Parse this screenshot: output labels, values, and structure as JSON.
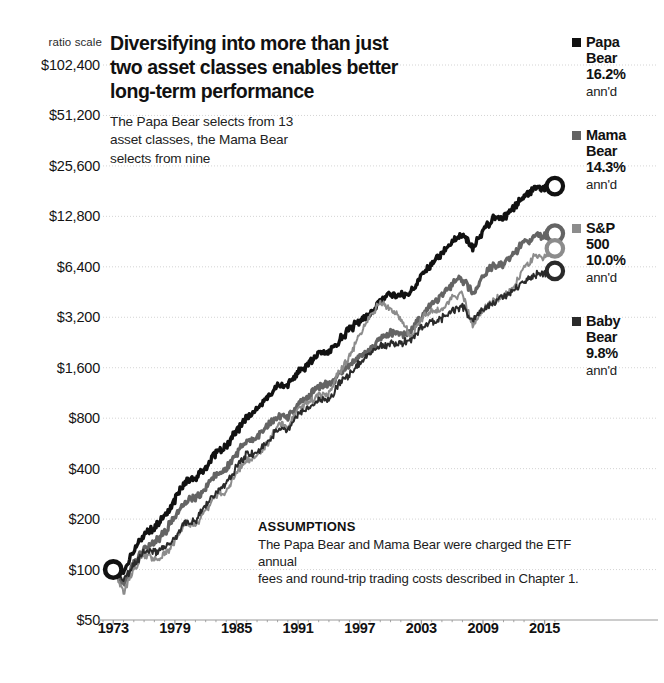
{
  "title": {
    "line1": "Diversifying into more than just",
    "line2": "two asset classes enables better",
    "line3": "long-term performance"
  },
  "subtitle": "The Papa Bear selects from 13 asset classes, the Mama Bear selects from nine",
  "scale_note": "ratio scale",
  "assumptions": {
    "heading": "ASSUMPTIONS",
    "line1": "The Papa Bear and Mama Bear were charged the ETF annual",
    "line2": "fees and round-trip trading costs described in Chapter 1."
  },
  "legend": [
    {
      "name_line1": "Papa",
      "name_line2": "Bear",
      "pct": "16.2%",
      "ann": "ann'd",
      "color": "#111111"
    },
    {
      "name_line1": "Mama",
      "name_line2": "Bear",
      "pct": "14.3%",
      "ann": "ann'd",
      "color": "#646464"
    },
    {
      "name_line1": "S&P",
      "name_line2": "500",
      "pct": "10.0%",
      "ann": "ann'd",
      "color": "#8c8c8c"
    },
    {
      "name_line1": "Baby",
      "name_line2": "Bear",
      "pct": "9.8%",
      "ann": "ann'd",
      "color": "#2a2a2a"
    }
  ],
  "chart_data": {
    "type": "line",
    "title": "Diversifying into more than just two asset classes enables better long-term performance",
    "subtitle": "The Papa Bear selects from 13 asset classes, the Mama Bear selects from nine",
    "xlabel": "",
    "ylabel": "",
    "scale": "log",
    "grid": true,
    "legend_position": "right",
    "xlim": [
      1972.0,
      2016.5
    ],
    "ylim": [
      50,
      102400
    ],
    "xticks": [
      1973,
      1979,
      1985,
      1991,
      1997,
      2003,
      2009,
      2015
    ],
    "xticklabels": [
      "1973",
      "1979",
      "1985",
      "1991",
      "1997",
      "2003",
      "2009",
      "2015"
    ],
    "yticks": [
      50,
      100,
      200,
      400,
      800,
      1600,
      3200,
      6400,
      12800,
      25600,
      51200,
      102400
    ],
    "yticklabels": [
      "$50",
      "$100",
      "$200",
      "$400",
      "$800",
      "$1,600",
      "$3,200",
      "$6,400",
      "$12,800",
      "$25,600",
      "$51,200",
      "$102,400"
    ],
    "start_marker": {
      "x": 1973,
      "y": 100,
      "label": "$100"
    },
    "series": [
      {
        "name": "Papa Bear",
        "annualized_pct": 16.2,
        "color": "#111111",
        "end_value": 72000,
        "x": [
          1973,
          1974,
          1975,
          1976,
          1977,
          1978,
          1979,
          1980,
          1981,
          1982,
          1983,
          1984,
          1985,
          1986,
          1987,
          1988,
          1989,
          1990,
          1991,
          1992,
          1993,
          1994,
          1995,
          1996,
          1997,
          1998,
          1999,
          2000,
          2001,
          2002,
          2003,
          2004,
          2005,
          2006,
          2007,
          2008,
          2009,
          2010,
          2011,
          2012,
          2013,
          2014,
          2015,
          2016
        ],
        "values": [
          100,
          96,
          130,
          160,
          178,
          206,
          262,
          330,
          352,
          406,
          500,
          546,
          672,
          812,
          902,
          1060,
          1230,
          1240,
          1500,
          1660,
          1950,
          1980,
          2330,
          2700,
          3060,
          3370,
          4000,
          4350,
          4280,
          4520,
          5700,
          6700,
          7700,
          9100,
          9900,
          8300,
          10400,
          12300,
          12500,
          14500,
          17000,
          18500,
          19000,
          19400
        ]
      },
      {
        "name": "Mama Bear",
        "annualized_pct": 14.3,
        "color": "#646464",
        "end_value": 38000,
        "x": [
          1973,
          1974,
          1975,
          1976,
          1977,
          1978,
          1979,
          1980,
          1981,
          1982,
          1983,
          1984,
          1985,
          1986,
          1987,
          1988,
          1989,
          1990,
          1991,
          1992,
          1993,
          1994,
          1995,
          1996,
          1997,
          1998,
          1999,
          2000,
          2001,
          2002,
          2003,
          2004,
          2005,
          2006,
          2007,
          2008,
          2009,
          2010,
          2011,
          2012,
          2013,
          2014,
          2015,
          2016
        ],
        "values": [
          100,
          82,
          108,
          134,
          146,
          166,
          208,
          254,
          266,
          306,
          372,
          400,
          490,
          580,
          622,
          720,
          824,
          812,
          980,
          1070,
          1250,
          1250,
          1460,
          1670,
          1870,
          2030,
          2380,
          2560,
          2500,
          2620,
          3260,
          3800,
          4300,
          5050,
          5400,
          4450,
          5600,
          6600,
          6650,
          7700,
          9000,
          9700,
          9900,
          10100
        ]
      },
      {
        "name": "S&P 500",
        "annualized_pct": 10.0,
        "color": "#8c8c8c",
        "end_value": 6100,
        "x": [
          1973,
          1974,
          1975,
          1976,
          1977,
          1978,
          1979,
          1980,
          1981,
          1982,
          1983,
          1984,
          1985,
          1986,
          1987,
          1988,
          1989,
          1990,
          1991,
          1992,
          1993,
          1994,
          1995,
          1996,
          1997,
          1998,
          1999,
          2000,
          2001,
          2002,
          2003,
          2004,
          2005,
          2006,
          2007,
          2008,
          2009,
          2010,
          2011,
          2012,
          2013,
          2014,
          2015,
          2016
        ],
        "values": [
          100,
          73,
          100,
          124,
          115,
          123,
          146,
          193,
          184,
          223,
          273,
          290,
          382,
          453,
          477,
          556,
          732,
          709,
          925,
          995,
          1095,
          1110,
          1527,
          1877,
          2503,
          3218,
          3894,
          3540,
          3119,
          2430,
          3127,
          3468,
          3637,
          4211,
          4442,
          2800,
          3540,
          4073,
          4159,
          4823,
          6387,
          7259,
          7360,
          8240
        ]
      },
      {
        "name": "Baby Bear",
        "annualized_pct": 9.8,
        "color": "#2a2a2a",
        "end_value": 5900,
        "x": [
          1973,
          1974,
          1975,
          1976,
          1977,
          1978,
          1979,
          1980,
          1981,
          1982,
          1983,
          1984,
          1985,
          1986,
          1987,
          1988,
          1989,
          1990,
          1991,
          1992,
          1993,
          1994,
          1995,
          1996,
          1997,
          1998,
          1999,
          2000,
          2001,
          2002,
          2003,
          2004,
          2005,
          2006,
          2007,
          2008,
          2009,
          2010,
          2011,
          2012,
          2013,
          2014,
          2015,
          2016
        ],
        "values": [
          100,
          85,
          106,
          128,
          126,
          134,
          155,
          190,
          196,
          246,
          291,
          320,
          410,
          486,
          498,
          566,
          686,
          690,
          862,
          930,
          1040,
          1020,
          1290,
          1450,
          1700,
          1960,
          2130,
          2240,
          2260,
          2330,
          2760,
          3040,
          3160,
          3520,
          3720,
          3020,
          3560,
          4000,
          4200,
          4600,
          5250,
          5700,
          5800,
          6050
        ]
      }
    ]
  }
}
